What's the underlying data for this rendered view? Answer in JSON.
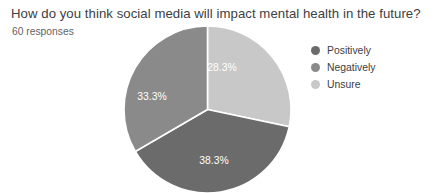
{
  "header": {
    "title": "How do you think social media will impact mental health in the future?",
    "responses": "60 responses"
  },
  "legend": {
    "items": [
      {
        "label": "Positively",
        "color": "#6b6b6b"
      },
      {
        "label": "Negatively",
        "color": "#8a8a8a"
      },
      {
        "label": "Unsure",
        "color": "#c8c8c8"
      }
    ]
  },
  "chart_data": {
    "type": "pie",
    "title": "How do you think social media will impact mental health in the future?",
    "subtitle": "60 responses",
    "total_responses": 60,
    "categories": [
      "Unsure",
      "Positively",
      "Negatively"
    ],
    "values": [
      28.3,
      38.3,
      33.3
    ],
    "unit": "percent",
    "start_angle_deg": 0,
    "direction": "clockwise",
    "legend_position": "right",
    "grid": false,
    "slices": [
      {
        "name": "Unsure",
        "value": 28.3,
        "label": "28.3%",
        "color": "#c8c8c8",
        "start_deg": 0,
        "end_deg": 101.9,
        "label_x": 222,
        "label_y": 68
      },
      {
        "name": "Positively",
        "value": 38.3,
        "label": "38.3%",
        "color": "#6b6b6b",
        "start_deg": 101.9,
        "end_deg": 239.8,
        "label_x": 214,
        "label_y": 161
      },
      {
        "name": "Negatively",
        "value": 33.3,
        "label": "33.3%",
        "color": "#8a8a8a",
        "start_deg": 239.8,
        "end_deg": 360,
        "label_x": 152,
        "label_y": 97
      }
    ]
  }
}
